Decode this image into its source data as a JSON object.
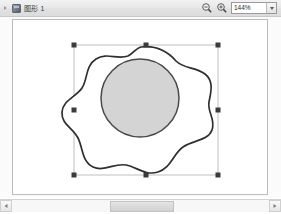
{
  "window": {
    "title": "图形 1",
    "document_icon": "document-icon",
    "expander_icon": "chevron-right-icon"
  },
  "toolbar": {
    "zoom_out_label": "zoom-out",
    "zoom_in_label": "zoom-in",
    "zoom_level": "144%",
    "zoom_dropdown_icon": "chevron-down-icon"
  },
  "canvas": {
    "background_color": "#ffffff",
    "page_border_color": "#bcbcbc",
    "shape": {
      "name": "blob-outline",
      "stroke_color": "#2f2f2f",
      "fill_color": "#ffffff",
      "stroke_width": 1.6
    },
    "inner_circle": {
      "name": "inner-circle",
      "fill_color": "#d4d4d4",
      "stroke_color": "#4a4a4a",
      "center_x": 127,
      "center_y": 78,
      "radius": 39
    },
    "selection": {
      "name": "selection-box",
      "line_color": "#b5b5b5",
      "handle_color": "#3b3b3b",
      "left": 61,
      "top": 25,
      "right": 205,
      "bottom": 155,
      "handle_count": 8
    }
  },
  "scrollbar": {
    "left_button_icon": "arrow-left-icon",
    "right_button_icon": "arrow-right-icon",
    "thumb_position_percent": 38,
    "thumb_width_percent": 25
  }
}
